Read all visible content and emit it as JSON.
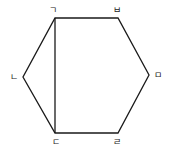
{
  "diagram": {
    "type": "hexagon",
    "stroke_color": "#1a1a1a",
    "vertices": [
      {
        "id": "giyeok",
        "label": "ㄱ",
        "x": 55,
        "y": 18,
        "lx": 53,
        "ly": 13
      },
      {
        "id": "bieup",
        "label": "ㅂ",
        "x": 118,
        "y": 18,
        "lx": 117,
        "ly": 13
      },
      {
        "id": "mieum",
        "label": "ㅁ",
        "x": 149,
        "y": 75,
        "lx": 158,
        "ly": 78
      },
      {
        "id": "rieul",
        "label": "ㄹ",
        "x": 118,
        "y": 133,
        "lx": 117,
        "ly": 145
      },
      {
        "id": "digeut",
        "label": "ㄷ",
        "x": 55,
        "y": 133,
        "lx": 56,
        "ly": 145
      },
      {
        "id": "nieun",
        "label": "ㄴ",
        "x": 23,
        "y": 77,
        "lx": 14,
        "ly": 80
      }
    ],
    "diagonals": [
      {
        "from": "ㄱ",
        "to": "ㄷ"
      }
    ]
  }
}
